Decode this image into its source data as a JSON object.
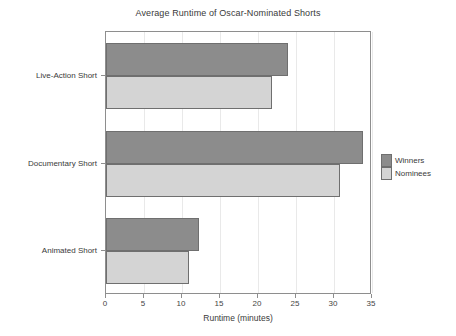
{
  "chart_data": {
    "type": "bar",
    "orientation": "horizontal",
    "title": "Average Runtime of Oscar-Nominated Shorts",
    "xlabel": "Runtime (minutes)",
    "ylabel": "",
    "categories": [
      "Live-Action Short",
      "Documentary Short",
      "Animated Short"
    ],
    "series": [
      {
        "name": "Winners",
        "color": "#8c8c8c",
        "values": [
          23.9,
          33.8,
          12.3
        ]
      },
      {
        "name": "Nominees",
        "color": "#d4d4d4",
        "values": [
          21.9,
          30.8,
          10.9
        ]
      }
    ],
    "xlim": [
      0,
      35
    ],
    "xticks": [
      0,
      5,
      10,
      15,
      20,
      25,
      30,
      35
    ],
    "xtick_labels": [
      "0",
      "5",
      "10",
      "15",
      "20",
      "25",
      "30",
      "35"
    ],
    "grid": "vertical-light",
    "legend_position": "right-center",
    "legend_entries": [
      "Winners",
      "Nominees"
    ],
    "frame_color": "#8e8e8e",
    "background": "#ffffff"
  }
}
